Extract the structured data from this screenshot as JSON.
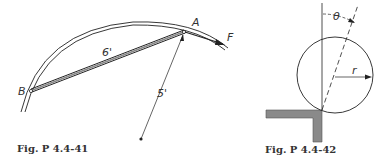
{
  "figures": [
    {
      "caption": "Fig. P 4.4-41",
      "labels": {
        "point_a": "A",
        "point_b": "B",
        "force": "F",
        "rod_length": "6'",
        "radius": "5'"
      }
    },
    {
      "caption": "Fig. P 4.4-42",
      "labels": {
        "angle": "θ",
        "radius": "r"
      }
    }
  ],
  "colors": {
    "line": "#222222",
    "wall_fill": "#8a8a8a"
  }
}
